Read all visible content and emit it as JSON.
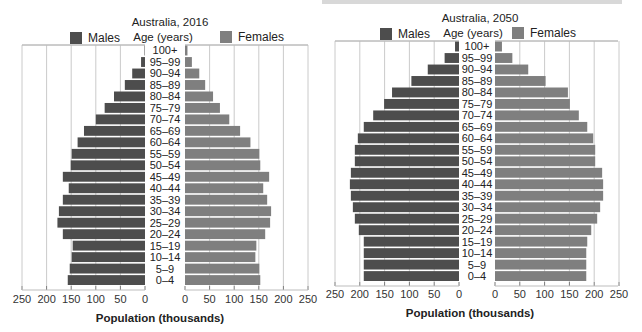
{
  "colors": {
    "males": "#4d4d4d",
    "females": "#7f7f7f",
    "grid": "#bdbdbd",
    "frame": "#9a9a9a",
    "separator": "#e0e0e0"
  },
  "legend": {
    "males": "Males",
    "females": "Females",
    "age_header": "Age (years)"
  },
  "chart_data": [
    {
      "type": "bar",
      "subtype": "population-pyramid",
      "title": "Australia, 2016",
      "xlabel": "Population (thousands)",
      "ylabel": "Age (years)",
      "xlim": [
        0,
        250
      ],
      "xticks": [
        0,
        50,
        100,
        150,
        200,
        250
      ],
      "grid": true,
      "legend_position": "top",
      "categories": [
        "100+",
        "95–99",
        "90–94",
        "85–89",
        "80–84",
        "75–79",
        "70–74",
        "65–69",
        "60–64",
        "55–59",
        "50–54",
        "45–49",
        "40–44",
        "35–39",
        "30–34",
        "25–29",
        "20–24",
        "15–19",
        "10–14",
        "5–9",
        "0–4"
      ],
      "series": [
        {
          "name": "Males",
          "values": [
            1,
            8,
            26,
            41,
            63,
            82,
            100,
            124,
            137,
            149,
            151,
            167,
            155,
            167,
            175,
            178,
            167,
            147,
            149,
            153,
            157
          ]
        },
        {
          "name": "Females",
          "values": [
            5,
            14,
            29,
            41,
            57,
            71,
            90,
            112,
            133,
            151,
            153,
            171,
            159,
            167,
            175,
            173,
            163,
            145,
            143,
            151,
            153
          ]
        }
      ]
    },
    {
      "type": "bar",
      "subtype": "population-pyramid",
      "title": "Australia, 2050",
      "xlabel": "Population (thousands)",
      "ylabel": "Age (years)",
      "xlim": [
        0,
        250
      ],
      "xticks": [
        0,
        50,
        100,
        150,
        200,
        250
      ],
      "grid": true,
      "legend_position": "top",
      "categories": [
        "100+",
        "95–99",
        "90–94",
        "85–89",
        "80–84",
        "75–79",
        "70–74",
        "65–69",
        "60–64",
        "55–59",
        "50–54",
        "45–49",
        "40–44",
        "35–39",
        "30–34",
        "25–29",
        "20–24",
        "15–19",
        "10–14",
        "5–9",
        "0–4"
      ],
      "series": [
        {
          "name": "Males",
          "values": [
            8,
            29,
            63,
            96,
            135,
            151,
            173,
            192,
            204,
            210,
            210,
            218,
            220,
            218,
            214,
            210,
            202,
            192,
            192,
            192,
            192
          ]
        },
        {
          "name": "Females",
          "values": [
            14,
            35,
            67,
            102,
            147,
            151,
            169,
            186,
            198,
            202,
            202,
            216,
            218,
            218,
            212,
            206,
            194,
            186,
            184,
            184,
            184
          ]
        }
      ]
    }
  ]
}
